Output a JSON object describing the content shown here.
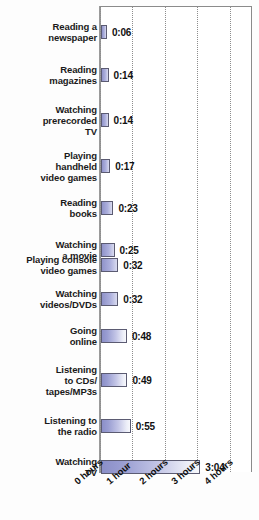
{
  "chart_data": {
    "type": "bar",
    "orientation": "horizontal",
    "title": "",
    "subtitle": "",
    "xlabel": "",
    "ylabel": "",
    "xlim": [
      0,
      4.6
    ],
    "grid": true,
    "legend": null,
    "x_tick_labels": [
      "0 hours",
      "1 hour",
      "2 hours",
      "3 hours",
      "4 hours"
    ],
    "x_tick_values": [
      0,
      1,
      2,
      3,
      4
    ],
    "categories": [
      "Reading a newspaper",
      "Reading magazines",
      "Watching prerecorded TV",
      "Playing handheld video games",
      "Reading books",
      "Watching a movie",
      "Playing console video games",
      "Watching videos/DVDs",
      "Going online",
      "Listening to CDs/ tapes/MP3s",
      "Listening to the radio",
      "Watching TV"
    ],
    "value_labels": [
      "0:06",
      "0:14",
      "0:14",
      "0:17",
      "0:23",
      "0:25",
      "0:32",
      "0:32",
      "0:48",
      "0:49",
      "0:55",
      "3:04"
    ],
    "values": [
      0.1,
      0.233,
      0.233,
      0.283,
      0.383,
      0.417,
      0.533,
      0.533,
      0.8,
      0.817,
      0.917,
      3.067
    ],
    "units": "hours:minutes"
  },
  "rows": [
    {
      "label_lines": [
        "Reading a",
        "newspaper"
      ],
      "value": "0:06"
    },
    {
      "label_lines": [
        "Reading",
        "magazines"
      ],
      "value": "0:14"
    },
    {
      "label_lines": [
        "Watching",
        "prerecorded",
        "TV"
      ],
      "value": "0:14"
    },
    {
      "label_lines": [
        "Playing",
        "handheld",
        "video games"
      ],
      "value": "0:17"
    },
    {
      "label_lines": [
        "Reading",
        "books"
      ],
      "value": "0:23"
    },
    {
      "label_lines": [
        "Watching",
        "a movie"
      ],
      "value": "0:25"
    },
    {
      "label_lines": [
        "Playing console",
        "video games"
      ],
      "value": "0:32"
    },
    {
      "label_lines": [
        "Watching",
        "videos/DVDs"
      ],
      "value": "0:32"
    },
    {
      "label_lines": [
        "Going",
        "online"
      ],
      "value": "0:48"
    },
    {
      "label_lines": [
        "Listening",
        "to CDs/",
        "tapes/MP3s"
      ],
      "value": "0:49"
    },
    {
      "label_lines": [
        "Listening to",
        "the radio"
      ],
      "value": "0:55"
    },
    {
      "label_lines": [
        "Watching",
        "TV"
      ],
      "value": "3:04"
    }
  ],
  "ticks": [
    {
      "label": "0 hours"
    },
    {
      "label": "1 hour"
    },
    {
      "label": "2 hours"
    },
    {
      "label": "3 hours"
    },
    {
      "label": "4 hours"
    }
  ],
  "colors": {
    "bar_fill_start": "#8b8fc8",
    "bar_fill_end": "#f7f8fc",
    "bar_border": "#5b5b72",
    "axis": "#9a9a9a",
    "gridline": "#8d8d8d",
    "text": "#111111",
    "background": "#ffffff"
  }
}
